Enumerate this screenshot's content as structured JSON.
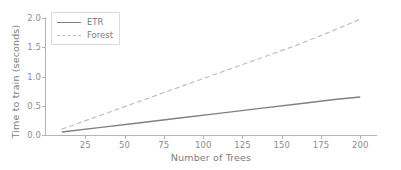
{
  "chart_data": {
    "type": "line",
    "title": "",
    "xlabel": "Number of Trees",
    "ylabel": "Time to train (seconds)",
    "xlim": [
      0,
      210
    ],
    "ylim": [
      0.0,
      2.0
    ],
    "xticks": [
      25,
      50,
      75,
      100,
      125,
      150,
      175,
      200
    ],
    "xtick_labels": [
      "25",
      "50",
      "75",
      "100",
      "125",
      "150",
      "175",
      "200"
    ],
    "yticks": [
      0.0,
      0.5,
      1.0,
      1.5,
      2.0
    ],
    "ytick_labels": [
      "0.0",
      "0.5",
      "1.0",
      "1.5",
      "2.0"
    ],
    "grid": false,
    "legend_position": "upper left",
    "x": [
      10,
      35,
      60,
      85,
      110,
      135,
      160,
      185,
      200
    ],
    "series": [
      {
        "name": "ETR",
        "style": "solid",
        "color": "#808080",
        "values": [
          0.05,
          0.13,
          0.21,
          0.29,
          0.37,
          0.45,
          0.53,
          0.61,
          0.65
        ]
      },
      {
        "name": "Forest",
        "style": "dashed",
        "color": "#bfbfbf",
        "values": [
          0.1,
          0.34,
          0.58,
          0.82,
          1.06,
          1.3,
          1.54,
          1.81,
          1.98
        ]
      }
    ]
  },
  "legend": {
    "entries": [
      {
        "label": "ETR"
      },
      {
        "label": "Forest"
      }
    ]
  },
  "colors": {
    "etr": "#808080",
    "forest": "#bfbfbf",
    "axis": "#b4b4b4",
    "tick_text": "#8d8d8d",
    "label_text": "#7d7d7d",
    "background": "#ffffff"
  }
}
